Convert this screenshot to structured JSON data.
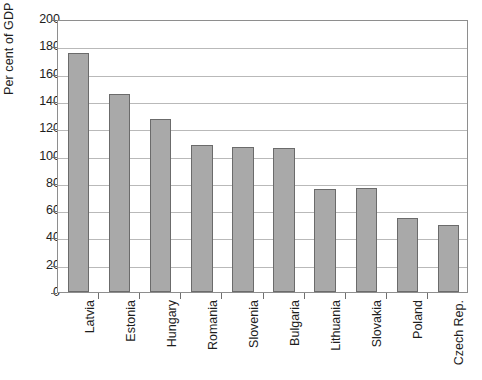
{
  "chart_data": {
    "type": "bar",
    "title": "",
    "subtitle": "",
    "xlabel": "",
    "ylabel": "Per cent of GDP",
    "ylim": [
      0,
      200
    ],
    "ytick_step": 20,
    "yticks": [
      0,
      20,
      40,
      60,
      80,
      100,
      120,
      140,
      160,
      180,
      200
    ],
    "grid": "horizontal",
    "legend": "none",
    "bar_color": "#a9a9a9",
    "bar_edge_color": "#6b6b6b",
    "axis_color": "#8e8e8e",
    "gridline_color": "#b9b9b9",
    "categories": [
      "Latvia",
      "Estonia",
      "Hungary",
      "Romania",
      "Slovenia",
      "Bulgaria",
      "Lithuania",
      "Slovakia",
      "Poland",
      "Czech Rep."
    ],
    "values": [
      175,
      145,
      127,
      108,
      106.5,
      105.5,
      75.5,
      76,
      54,
      49
    ]
  }
}
